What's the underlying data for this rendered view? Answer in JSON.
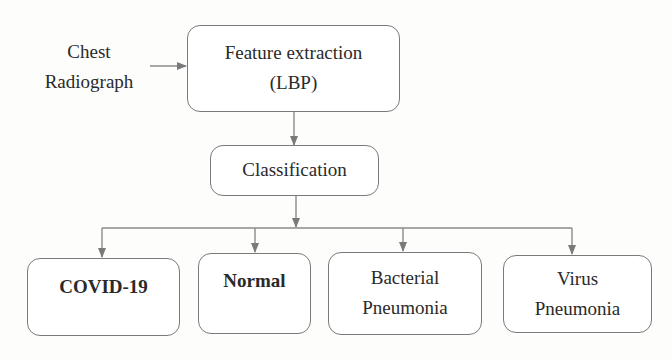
{
  "diagram": {
    "input": {
      "line1": "Chest",
      "line2": "Radiograph"
    },
    "feature_box": {
      "line1": "Feature extraction",
      "line2": "(LBP)"
    },
    "classification_box": {
      "label": "Classification"
    },
    "outputs": [
      {
        "line1": "COVID-19",
        "line2": ""
      },
      {
        "line1": "Normal",
        "line2": ""
      },
      {
        "line1": "Bacterial",
        "line2": "Pneumonia"
      },
      {
        "line1": "Virus",
        "line2": "Pneumonia"
      }
    ],
    "colors": {
      "stroke": "#7a7a7a",
      "text": "#2a2a2a"
    }
  }
}
